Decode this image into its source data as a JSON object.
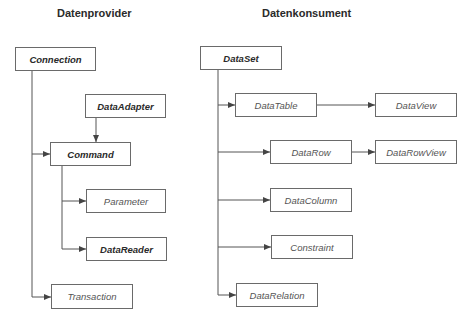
{
  "provider": {
    "heading": "Datenprovider",
    "nodes": {
      "connection": {
        "label": "Connection",
        "bold": true
      },
      "data_adapter": {
        "label": "DataAdapter",
        "bold": true
      },
      "command": {
        "label": "Command",
        "bold": true
      },
      "parameter": {
        "label": "Parameter",
        "bold": false
      },
      "data_reader": {
        "label": "DataReader",
        "bold": true
      },
      "transaction": {
        "label": "Transaction",
        "bold": false
      }
    }
  },
  "consumer": {
    "heading": "Datenkonsument",
    "nodes": {
      "data_set": {
        "label": "DataSet",
        "bold": true
      },
      "data_table": {
        "label": "DataTable",
        "bold": false
      },
      "data_view": {
        "label": "DataView",
        "bold": false
      },
      "data_row": {
        "label": "DataRow",
        "bold": false
      },
      "data_row_view": {
        "label": "DataRowView",
        "bold": false
      },
      "data_column": {
        "label": "DataColumn",
        "bold": false
      },
      "constraint": {
        "label": "Constraint",
        "bold": false
      },
      "data_relation": {
        "label": "DataRelation",
        "bold": false
      }
    }
  },
  "colors": {
    "line": "#555555",
    "border": "#6a6a6a",
    "text": "#555555",
    "bold_text": "#2a2a2a"
  }
}
